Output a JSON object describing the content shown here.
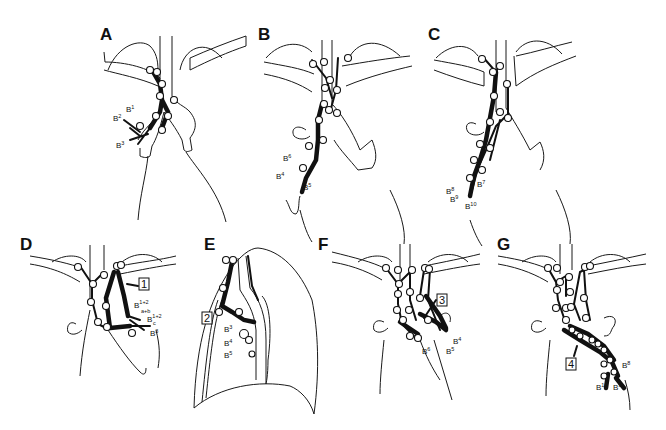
{
  "figure": {
    "panels": [
      {
        "id": "A",
        "label": "A",
        "bronchi": [
          "B1",
          "B2",
          "B3"
        ],
        "bronchi_display": {
          "b1": "B",
          "b1s": "1",
          "b2": "B",
          "b2s": "2",
          "b3": "B",
          "b3s": "3"
        }
      },
      {
        "id": "B",
        "label": "B",
        "bronchi_display": {
          "b6": "B",
          "b6s": "6",
          "b4": "B",
          "b4s": "4",
          "b5": "B",
          "b5s": "5"
        }
      },
      {
        "id": "C",
        "label": "C",
        "bronchi_display": {
          "b7": "B",
          "b7s": "7",
          "b8": "B",
          "b8s": "8",
          "b9": "B",
          "b9s": "9",
          "b10": "B",
          "b10s": "10"
        }
      },
      {
        "id": "D",
        "label": "D",
        "callout": "1",
        "bronchi_display": {
          "b12ab": "B",
          "b12ab_sup": "1+2",
          "b12ab_sub": "a+b",
          "b12c": "B",
          "b12c_sup": "1+2",
          "b12c_sub": "c",
          "b3": "B",
          "b3s": "3"
        }
      },
      {
        "id": "E",
        "label": "E",
        "callout": "2",
        "bronchi_display": {
          "b3": "B",
          "b3s": "3",
          "b4": "B",
          "b4s": "4",
          "b5": "B",
          "b5s": "5"
        }
      },
      {
        "id": "F",
        "label": "F",
        "callout": "3",
        "bronchi_display": {
          "b4": "B",
          "b4s": "4",
          "b5": "B",
          "b5s": "5",
          "b6": "B",
          "b6s": "6"
        }
      },
      {
        "id": "G",
        "label": "G",
        "callout": "4",
        "bronchi_display": {
          "b8": "B",
          "b8s": "8",
          "b9": "B",
          "b9s": "9",
          "b10": "B",
          "b10s": "10"
        }
      }
    ]
  }
}
